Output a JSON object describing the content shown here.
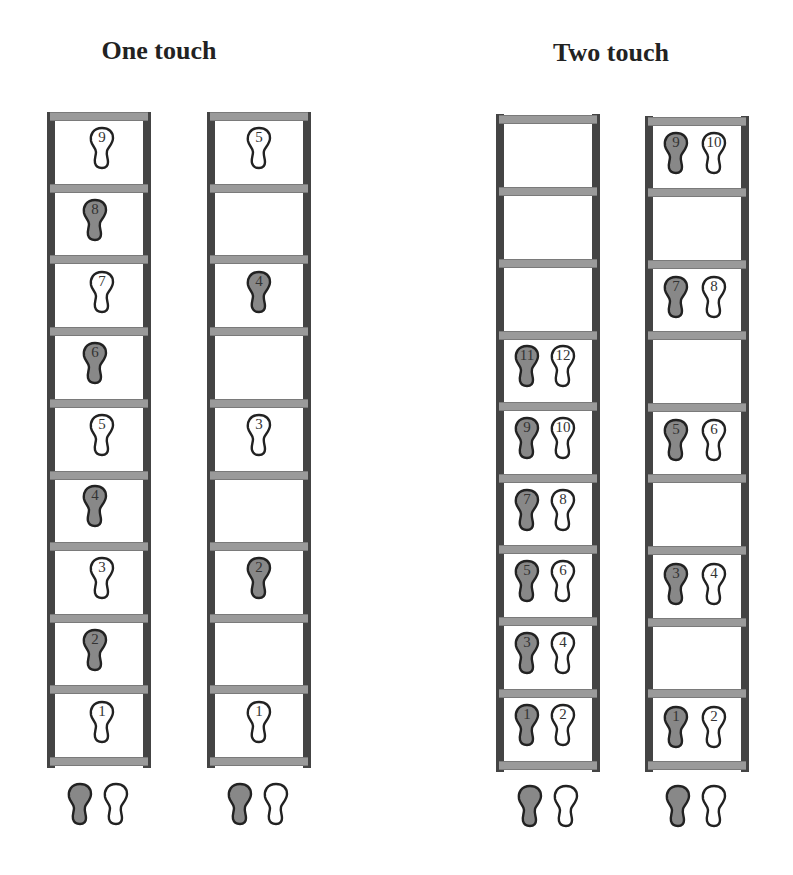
{
  "titles": {
    "left": "One touch",
    "right": "Two touch"
  },
  "colors": {
    "rail": "#444444",
    "rung": "#9a9a9a",
    "stance_foot": "#888888",
    "swing_foot": "#ffffff",
    "outline": "#222222"
  },
  "ladders": [
    {
      "id": "one-touch-a",
      "x": 47,
      "top": 112,
      "height": 656,
      "rungs": [
        115,
        187,
        258,
        330,
        402,
        474,
        545,
        617,
        688,
        760
      ],
      "steps": [
        {
          "label": "1",
          "foot": "right",
          "y": 700,
          "dx": 40
        },
        {
          "label": "2",
          "foot": "left",
          "y": 628,
          "dx": 33
        },
        {
          "label": "3",
          "foot": "right",
          "y": 556,
          "dx": 40
        },
        {
          "label": "4",
          "foot": "left",
          "y": 484,
          "dx": 33
        },
        {
          "label": "5",
          "foot": "right",
          "y": 413,
          "dx": 40
        },
        {
          "label": "6",
          "foot": "left",
          "y": 341,
          "dx": 33
        },
        {
          "label": "7",
          "foot": "right",
          "y": 270,
          "dx": 40
        },
        {
          "label": "8",
          "foot": "left",
          "y": 198,
          "dx": 33
        },
        {
          "label": "9",
          "foot": "right",
          "y": 126,
          "dx": 40
        }
      ]
    },
    {
      "id": "one-touch-b",
      "x": 207,
      "top": 112,
      "height": 656,
      "rungs": [
        115,
        187,
        258,
        330,
        402,
        474,
        545,
        617,
        688,
        760
      ],
      "steps": [
        {
          "label": "1",
          "foot": "right",
          "y": 700,
          "dx": 37
        },
        {
          "label": "2",
          "foot": "left",
          "y": 556,
          "dx": 37
        },
        {
          "label": "3",
          "foot": "right",
          "y": 413,
          "dx": 37
        },
        {
          "label": "4",
          "foot": "left",
          "y": 270,
          "dx": 37
        },
        {
          "label": "5",
          "foot": "right",
          "y": 126,
          "dx": 37
        }
      ]
    },
    {
      "id": "two-touch-a",
      "x": 496,
      "top": 114,
      "height": 658,
      "rungs": [
        118,
        190,
        262,
        334,
        405,
        477,
        548,
        620,
        692,
        764
      ],
      "steps": [
        {
          "label": "1",
          "foot": "left",
          "y": 703,
          "dx": 16
        },
        {
          "label": "2",
          "foot": "right",
          "y": 703,
          "dx": 52
        },
        {
          "label": "3",
          "foot": "left",
          "y": 631,
          "dx": 16
        },
        {
          "label": "4",
          "foot": "right",
          "y": 631,
          "dx": 52
        },
        {
          "label": "5",
          "foot": "left",
          "y": 559,
          "dx": 16
        },
        {
          "label": "6",
          "foot": "right",
          "y": 559,
          "dx": 52
        },
        {
          "label": "7",
          "foot": "left",
          "y": 488,
          "dx": 16
        },
        {
          "label": "8",
          "foot": "right",
          "y": 488,
          "dx": 52
        },
        {
          "label": "9",
          "foot": "left",
          "y": 416,
          "dx": 16
        },
        {
          "label": "10",
          "foot": "right",
          "y": 416,
          "dx": 52
        },
        {
          "label": "11",
          "foot": "left",
          "y": 344,
          "dx": 16
        },
        {
          "label": "12",
          "foot": "right",
          "y": 344,
          "dx": 52
        }
      ]
    },
    {
      "id": "two-touch-b",
      "x": 645,
      "top": 116,
      "height": 656,
      "rungs": [
        120,
        191,
        263,
        334,
        406,
        477,
        549,
        621,
        692,
        764
      ],
      "steps": [
        {
          "label": "1",
          "foot": "left",
          "y": 705,
          "dx": 16
        },
        {
          "label": "2",
          "foot": "right",
          "y": 705,
          "dx": 54
        },
        {
          "label": "3",
          "foot": "left",
          "y": 562,
          "dx": 16
        },
        {
          "label": "4",
          "foot": "right",
          "y": 562,
          "dx": 54
        },
        {
          "label": "5",
          "foot": "left",
          "y": 418,
          "dx": 16
        },
        {
          "label": "6",
          "foot": "right",
          "y": 418,
          "dx": 54
        },
        {
          "label": "7",
          "foot": "left",
          "y": 275,
          "dx": 16
        },
        {
          "label": "8",
          "foot": "right",
          "y": 275,
          "dx": 54
        },
        {
          "label": "9",
          "foot": "left",
          "y": 131,
          "dx": 16
        },
        {
          "label": "10",
          "foot": "right",
          "y": 131,
          "dx": 54
        }
      ]
    }
  ],
  "start_feet": [
    {
      "x": 65,
      "y": 782
    },
    {
      "x": 225,
      "y": 782
    },
    {
      "x": 515,
      "y": 784
    },
    {
      "x": 663,
      "y": 784
    }
  ]
}
